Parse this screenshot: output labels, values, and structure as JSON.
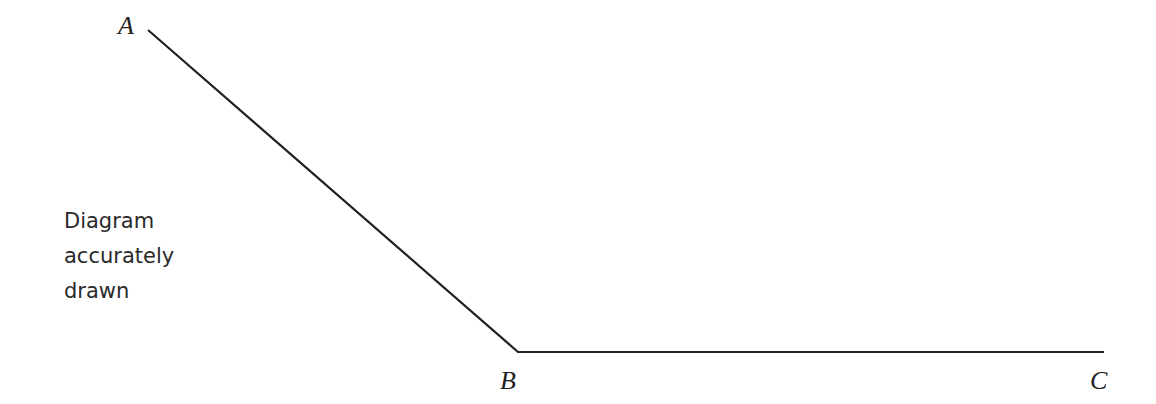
{
  "diagram": {
    "type": "angle",
    "points": [
      {
        "label": "A",
        "x": 148,
        "y": 30
      },
      {
        "label": "B",
        "x": 518,
        "y": 352
      },
      {
        "label": "C",
        "x": 1104,
        "y": 352
      }
    ],
    "segments": [
      [
        "A",
        "B"
      ],
      [
        "B",
        "C"
      ]
    ],
    "line_color": "#222222",
    "note_lines": [
      "Diagram",
      "accurately",
      "drawn"
    ]
  }
}
